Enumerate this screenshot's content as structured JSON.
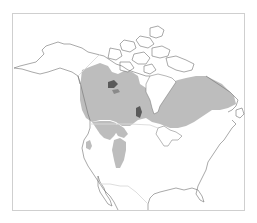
{
  "map": {
    "type": "range-map",
    "region": "North America",
    "colors": {
      "background": "#ffffff",
      "frame": "#cfcfcf",
      "coastline": "#6e6e6e",
      "range_fill": "#bdbdbd",
      "political_border": "#dadada"
    },
    "legend": [],
    "labels": []
  }
}
